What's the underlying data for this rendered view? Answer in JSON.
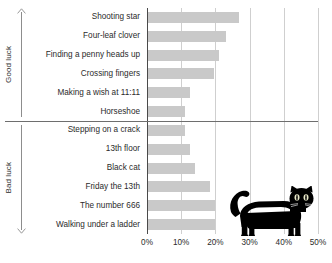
{
  "chart_data": {
    "type": "bar",
    "orientation": "horizontal",
    "title": "",
    "subtitle": "",
    "xlabel": "",
    "ylabel": "",
    "xlim": [
      0,
      50
    ],
    "x_tick_labels": [
      "0%",
      "10%",
      "20%",
      "30%",
      "40%",
      "50%"
    ],
    "x_ticks": [
      0,
      10,
      20,
      30,
      40,
      50
    ],
    "grid": true,
    "grid_axis": "x",
    "legend": false,
    "unit": "%",
    "bar_color": "#c9c9c9",
    "categories": [
      "Shooting star",
      "Four-leaf clover",
      "Finding a penny heads up",
      "Crossing fingers",
      "Making a wish at 11:11",
      "Horseshoe",
      "Stepping on a crack",
      "13th floor",
      "Black cat",
      "Friday the 13th",
      "The number 666",
      "Walking under a ladder"
    ],
    "values": [
      27,
      23,
      21,
      19.5,
      12.5,
      11,
      11,
      12.5,
      14,
      18.5,
      20,
      20
    ],
    "groups": [
      {
        "label": "Good luck",
        "arrow": "up",
        "categories": [
          "Shooting star",
          "Four-leaf clover",
          "Finding a penny heads up",
          "Crossing fingers",
          "Making a wish at 11:11",
          "Horseshoe"
        ],
        "values": [
          27,
          23,
          21,
          19.5,
          12.5,
          11
        ]
      },
      {
        "label": "Bad luck",
        "arrow": "down",
        "categories": [
          "Stepping on a crack",
          "13th floor",
          "Black cat",
          "Friday the 13th",
          "The number 666",
          "Walking under a ladder"
        ],
        "values": [
          11,
          12.5,
          14,
          18.5,
          20,
          20
        ]
      }
    ],
    "annotations": [
      {
        "name": "black-cat-silhouette",
        "description": "black cat silhouette illustration"
      }
    ]
  },
  "colors": {
    "bar": "#c9c9c9",
    "grid": "#cfcfcf",
    "axis": "#4a4a4a",
    "divider": "#6e6e6e",
    "text": "#2b2b2b",
    "cat": "#000000",
    "background": "#ffffff"
  }
}
